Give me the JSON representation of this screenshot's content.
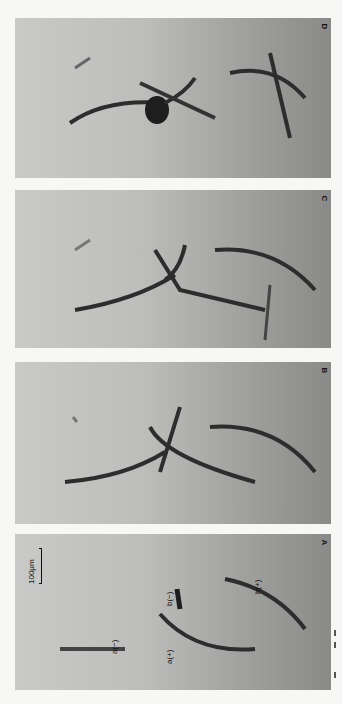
{
  "figure": {
    "orientation": "rotated-90",
    "panels": [
      {
        "id": "D",
        "letter": "D",
        "top": 18,
        "height": 160
      },
      {
        "id": "C",
        "letter": "C",
        "top": 190,
        "height": 158
      },
      {
        "id": "B",
        "letter": "B",
        "top": 362,
        "height": 162
      },
      {
        "id": "A",
        "letter": "A",
        "top": 534,
        "height": 156
      }
    ],
    "scale_bar": {
      "label": "100μm"
    },
    "annotations": {
      "a_minus": "a(−)",
      "a_plus": "a(+)",
      "b_minus": "b(−)",
      "b_plus": "b(+)"
    },
    "colors": {
      "background": "#f7f7f5",
      "fiber": "#2a2a2a",
      "panel_light": "#c9c9c7",
      "panel_dark": "#8a8a88"
    }
  }
}
